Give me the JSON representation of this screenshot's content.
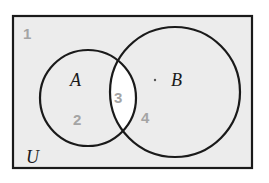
{
  "diagram": {
    "type": "venn",
    "universe_label": "U",
    "sets": [
      {
        "id": "A",
        "label": "A"
      },
      {
        "id": "B",
        "label": "B"
      }
    ],
    "regions": [
      {
        "number": "1",
        "description": "outside A and B"
      },
      {
        "number": "2",
        "description": "A only"
      },
      {
        "number": "3",
        "description": "A and B"
      },
      {
        "number": "4",
        "description": "B only"
      }
    ],
    "colors": {
      "background": "#ececec",
      "intersection": "#ffffff",
      "outline": "#1a1a1a",
      "region_number": "#a4a4a4"
    }
  }
}
